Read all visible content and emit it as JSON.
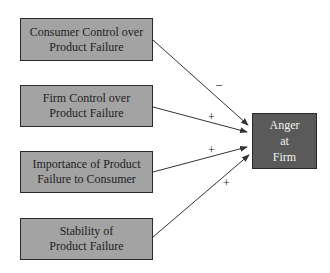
{
  "diagram": {
    "type": "path-model",
    "antecedents": [
      {
        "id": "consumer-control",
        "label": "Consumer Control over\nProduct Failure",
        "sign": "–"
      },
      {
        "id": "firm-control",
        "label": "Firm Control over\nProduct Failure",
        "sign": "+"
      },
      {
        "id": "importance",
        "label": "Importance of Product\nFailure to Consumer",
        "sign": "+"
      },
      {
        "id": "stability",
        "label": "Stability of\nProduct Failure",
        "sign": "+"
      }
    ],
    "outcome": {
      "id": "anger",
      "label": "Anger\nat\nFirm"
    },
    "colors": {
      "antecedent_fill": "#a3a3a3",
      "outcome_fill": "#5a5a5a",
      "border": "#2a2a2a",
      "arrow": "#333333"
    }
  }
}
